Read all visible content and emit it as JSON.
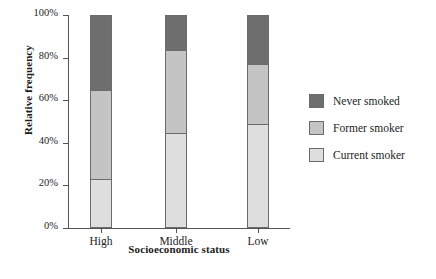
{
  "chart_data": {
    "type": "bar",
    "subtype": "stacked-bar-100pct",
    "title": "",
    "xlabel": "Socioeconomic status",
    "ylabel": "Relative frequency",
    "categories": [
      "High",
      "Middle",
      "Low"
    ],
    "ylim": [
      0,
      100
    ],
    "ytick_labels": [
      "0%",
      "20%",
      "40%",
      "60%",
      "80%",
      "100%"
    ],
    "ytick_values": [
      0,
      20,
      40,
      60,
      80,
      100
    ],
    "grid": false,
    "legend_position": "right",
    "series": [
      {
        "name": "Never smoked",
        "color": "#6e6e6e",
        "values": [
          35.7,
          16.4,
          23.0
        ]
      },
      {
        "name": "Former smoker",
        "color": "#c4c4c4",
        "values": [
          41.8,
          39.5,
          28.6
        ]
      },
      {
        "name": "Current smoker",
        "color": "#dedede",
        "values": [
          22.5,
          44.1,
          48.4
        ]
      }
    ],
    "cumulative_boundaries_pct": {
      "High": [
        22.5,
        64.3,
        100.0
      ],
      "Middle": [
        44.1,
        83.6,
        100.0
      ],
      "Low": [
        48.4,
        77.0,
        100.0
      ]
    }
  },
  "style": {
    "axis_color": "#555555",
    "bar_outline": "#6b6b6b",
    "background": "#ffffff"
  }
}
